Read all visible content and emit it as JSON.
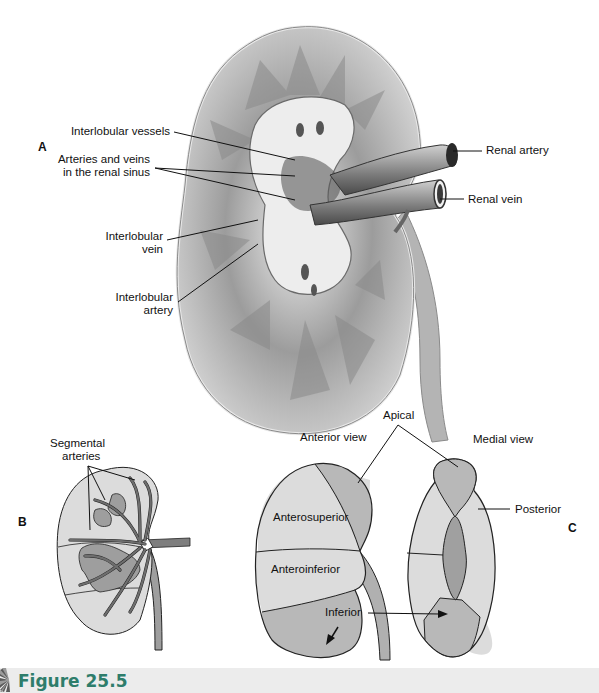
{
  "figure": {
    "caption": "Figure 25.5",
    "caption_color": "#2e7d6b"
  },
  "panel_a": {
    "letter": "A",
    "labels": {
      "interlobular_vessels": "Interlobular vessels",
      "arteries_veins_line1": "Arteries and veins",
      "arteries_veins_line2": "in the renal sinus",
      "interlobular_vein_line1": "Interlobular",
      "interlobular_vein_line2": "vein",
      "interlobular_artery_line1": "Interlobular",
      "interlobular_artery_line2": "artery",
      "renal_artery": "Renal artery",
      "renal_vein": "Renal vein"
    }
  },
  "panel_b": {
    "letter": "B",
    "labels": {
      "segmental_line1": "Segmental",
      "segmental_line2": "arteries"
    }
  },
  "panel_c": {
    "letter": "C",
    "labels": {
      "apical": "Apical",
      "anterior_view": "Anterior view",
      "medial_view": "Medial view",
      "anterosuperior": "Anterosuperior",
      "anteroinferior": "Anteroinferior",
      "inferior": "Inferior",
      "posterior": "Posterior"
    }
  },
  "colors": {
    "light_segment": "#dcdcdc",
    "mid_segment": "#b8b8b8",
    "dark_segment": "#9a9a9a",
    "outline": "#222222"
  }
}
